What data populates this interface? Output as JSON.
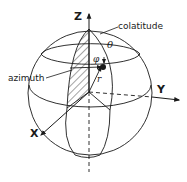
{
  "diagram": {
    "type": "spherical-coordinates",
    "axes": {
      "z": "Z",
      "y": "Y",
      "x": "X"
    },
    "labels": {
      "colatitude": "colatitude",
      "azimuth": "azimuth",
      "theta": "θ",
      "phi": "φ",
      "r": "r"
    },
    "colors": {
      "line": "#1a1a1a",
      "background": "#ffffff"
    }
  }
}
